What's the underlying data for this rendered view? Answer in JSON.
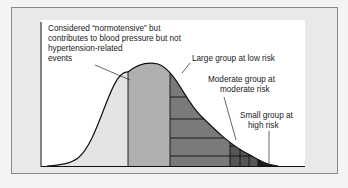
{
  "diagram": {
    "type": "normal distribution curve with risk segments",
    "labels": {
      "normotensive_line1": "Considered “normotensive” but",
      "normotensive_line2": "contributes to blood pressure but not",
      "normotensive_line3": "hypertension-related",
      "normotensive_line4": "events",
      "large_group": "Large group at low risk",
      "moderate_line1": "Moderate group at",
      "moderate_line2": "moderate risk",
      "small_line1": "Small group at",
      "small_line2": "high risk"
    },
    "colors": {
      "background": "#f4f4f4",
      "frame": "#e9e9e9",
      "panel": "#ffffff",
      "left_tail": "#e4e4e4",
      "normotensive": "#b0b0b0",
      "low_risk": "#7a7a7a",
      "moderate_risk": "#555555",
      "high_risk": "#1a1a1a",
      "line": "#111111"
    }
  }
}
